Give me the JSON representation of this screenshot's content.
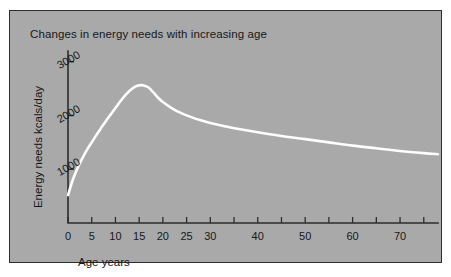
{
  "figure": {
    "background_color": "#ffffff",
    "panel_color": "#a9a9a9",
    "border_color": "#2e2e2e",
    "curve_color": "#fdfdfd",
    "text_color": "#17181a"
  },
  "chart_data": {
    "type": "line",
    "title": "Changes in energy needs with increasing age",
    "xlabel": "Age  years",
    "ylabel": "Energy needs  kcals/day",
    "xlim": [
      0,
      78
    ],
    "ylim": [
      0,
      3200
    ],
    "grid": false,
    "legend": null,
    "x_tick_values": [
      0,
      5,
      10,
      15,
      20,
      25,
      30,
      35,
      40,
      45,
      50,
      55,
      60,
      65,
      70,
      75
    ],
    "x_tick_labels": [
      "0",
      "5",
      "10",
      "15",
      "20",
      "25",
      "30",
      "",
      "40",
      "",
      "50",
      "",
      "60",
      "",
      "70",
      ""
    ],
    "y_tick_values": [
      1000,
      2000,
      3000
    ],
    "y_tick_labels": [
      "1000",
      "2000",
      "3000"
    ],
    "series": [
      {
        "name": "Energy needs",
        "x": [
          0,
          1,
          2,
          3,
          4,
          5,
          6,
          7,
          8,
          9,
          10,
          11,
          12,
          13,
          14,
          15,
          16,
          17,
          18,
          19,
          20,
          22,
          24,
          26,
          28,
          30,
          33,
          36,
          40,
          45,
          50,
          55,
          60,
          65,
          70,
          75,
          78
        ],
        "values": [
          520,
          800,
          1020,
          1200,
          1360,
          1500,
          1640,
          1770,
          1900,
          2020,
          2140,
          2260,
          2370,
          2460,
          2530,
          2560,
          2560,
          2520,
          2430,
          2330,
          2250,
          2130,
          2040,
          1970,
          1910,
          1860,
          1800,
          1750,
          1690,
          1620,
          1560,
          1500,
          1440,
          1390,
          1340,
          1300,
          1280
        ]
      }
    ],
    "annotations": []
  }
}
